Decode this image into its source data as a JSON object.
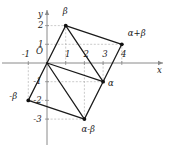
{
  "figure": {
    "kind": "complex-plane-vector-diagram",
    "axis_labels": {
      "x": "x",
      "y": "y",
      "origin": "O"
    },
    "colors": {
      "axis": "#8a8a8a",
      "grid_dash": "#b5b5b5",
      "edge": "#1a1a1a",
      "point": "#111111",
      "text": "#1a1a1a",
      "background": "#ffffff"
    }
  },
  "chart_data": {
    "type": "scatter",
    "title": "",
    "xlabel": "x",
    "ylabel": "y",
    "xlim": [
      -1.7,
      5.2
    ],
    "ylim": [
      -3.9,
      2.9
    ],
    "grid": false,
    "x_ticks": [
      -1,
      1,
      2,
      3,
      4
    ],
    "x_tick_labels": [
      "-1",
      "1",
      "2",
      "3",
      "4"
    ],
    "y_ticks": [
      2,
      1,
      -1,
      -2,
      -3
    ],
    "y_tick_labels": [
      "2",
      "1",
      "-1",
      "-2",
      "-3"
    ],
    "points": [
      {
        "name": "origin",
        "label": "O",
        "x": 0,
        "y": 0,
        "marker": false,
        "label_dx": -11,
        "label_dy": -12
      },
      {
        "name": "beta",
        "label": "β",
        "x": 1,
        "y": 2,
        "marker": true,
        "label_dx": -3,
        "label_dy": -15
      },
      {
        "name": "alpha-plus-beta",
        "label": "α+β",
        "x": 4,
        "y": 1,
        "marker": true,
        "label_dx": 6,
        "label_dy": -11
      },
      {
        "name": "alpha",
        "label": "α",
        "x": 3,
        "y": -1,
        "marker": true,
        "label_dx": 5,
        "label_dy": 1
      },
      {
        "name": "minus-beta",
        "label": "-β",
        "x": -1,
        "y": -2,
        "marker": true,
        "label_dx": -19,
        "label_dy": -4
      },
      {
        "name": "alpha-minus-beta",
        "label": "α-β",
        "x": 2,
        "y": -3,
        "marker": true,
        "label_dx": -3,
        "label_dy": 10
      }
    ],
    "edges": [
      {
        "name": "origin-to-beta",
        "from": [
          0,
          0
        ],
        "to": [
          1,
          2
        ]
      },
      {
        "name": "beta-to-alpha-plus-beta",
        "from": [
          1,
          2
        ],
        "to": [
          4,
          1
        ]
      },
      {
        "name": "alpha-plus-beta-to-alpha",
        "from": [
          4,
          1
        ],
        "to": [
          3,
          -1
        ]
      },
      {
        "name": "alpha-to-origin",
        "from": [
          3,
          -1
        ],
        "to": [
          0,
          0
        ]
      },
      {
        "name": "beta-to-alpha-diagonal",
        "from": [
          1,
          2
        ],
        "to": [
          3,
          -1
        ]
      },
      {
        "name": "origin-to-minus-beta",
        "from": [
          0,
          0
        ],
        "to": [
          -1,
          -2
        ]
      },
      {
        "name": "minus-beta-to-alpha-minus-beta",
        "from": [
          -1,
          -2
        ],
        "to": [
          2,
          -3
        ]
      },
      {
        "name": "alpha-minus-beta-to-alpha",
        "from": [
          2,
          -3
        ],
        "to": [
          3,
          -1
        ]
      },
      {
        "name": "origin-to-alpha-minus-beta-diagonal",
        "from": [
          0,
          0
        ],
        "to": [
          2,
          -3
        ]
      }
    ],
    "guide_lines": [
      {
        "name": "guide-beta-vertical",
        "from": [
          1,
          0
        ],
        "to": [
          1,
          2
        ]
      },
      {
        "name": "guide-beta-horizontal",
        "from": [
          0,
          2
        ],
        "to": [
          1,
          2
        ]
      },
      {
        "name": "guide-alpha-plus-beta-horizontal",
        "from": [
          0,
          1
        ],
        "to": [
          4,
          1
        ]
      },
      {
        "name": "guide-alpha-plus-beta-vertical",
        "from": [
          4,
          0
        ],
        "to": [
          4,
          1
        ]
      },
      {
        "name": "guide-alpha-vertical",
        "from": [
          3,
          0
        ],
        "to": [
          3,
          -1
        ]
      },
      {
        "name": "guide-alpha-horizontal",
        "from": [
          0,
          -1
        ],
        "to": [
          3,
          -1
        ]
      },
      {
        "name": "guide-alpha-minus-beta-vertical",
        "from": [
          2,
          0
        ],
        "to": [
          2,
          -3
        ]
      },
      {
        "name": "guide-alpha-minus-beta-horizontal",
        "from": [
          0,
          -3
        ],
        "to": [
          2,
          -3
        ]
      },
      {
        "name": "guide-minus-beta-vertical",
        "from": [
          -1,
          0
        ],
        "to": [
          -1,
          -2
        ]
      },
      {
        "name": "guide-minus-beta-horizontal",
        "from": [
          0,
          -2
        ],
        "to": [
          -1,
          -2
        ]
      }
    ]
  }
}
